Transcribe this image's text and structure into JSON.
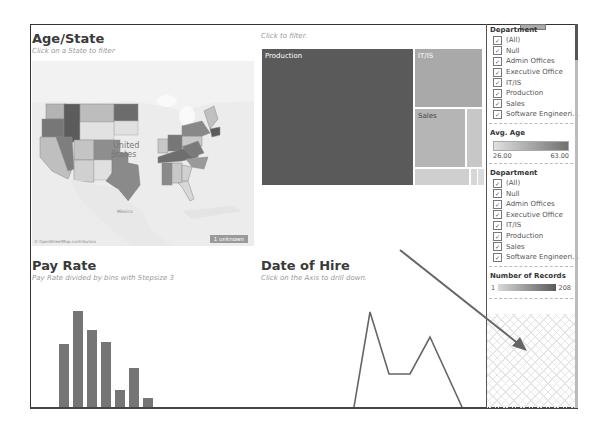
{
  "age_state": {
    "title": "Age/State",
    "subtitle": "Click on a State to filter",
    "map_label_line1": "United",
    "map_label_line2": "States",
    "mexico_label": "Mexico",
    "attribution": "© OpenStreetMap contributors",
    "unknown_badge": "1 unknown"
  },
  "treemap": {
    "subtitle": "Click to filter.",
    "cells": [
      {
        "label": "Production",
        "x": 0,
        "y": 0,
        "w": 153,
        "h": 138,
        "color": "#5a5a5a",
        "text_color": "#ffffff"
      },
      {
        "label": "IT/IS",
        "x": 153,
        "y": 0,
        "w": 69,
        "h": 60,
        "color": "#a9a9a9",
        "text_color": "#ffffff"
      },
      {
        "label": "Sales",
        "x": 153,
        "y": 60,
        "w": 52,
        "h": 60,
        "color": "#b5b5b5",
        "text_color": "#444444"
      },
      {
        "label": "",
        "x": 205,
        "y": 60,
        "w": 17,
        "h": 60,
        "color": "#c7c7c7",
        "text_color": "#444444"
      },
      {
        "label": "",
        "x": 153,
        "y": 120,
        "w": 56,
        "h": 18,
        "color": "#cfcfcf",
        "text_color": "#444444"
      },
      {
        "label": "",
        "x": 209,
        "y": 120,
        "w": 7,
        "h": 18,
        "color": "#d6d6d6",
        "text_color": "#444444"
      },
      {
        "label": "",
        "x": 216,
        "y": 120,
        "w": 6,
        "h": 18,
        "color": "#dcdcdc",
        "text_color": "#444444"
      }
    ]
  },
  "side_panel": {
    "filter1": {
      "title": "Department",
      "items": [
        "(All)",
        "Null",
        "Admin Offices",
        "Executive Office",
        "IT/IS",
        "Production",
        "Sales",
        "Software Engineeri..."
      ]
    },
    "avg_age": {
      "title": "Avg. Age",
      "min": "26.00",
      "max": "63.00"
    },
    "filter2": {
      "title": "Department",
      "items": [
        "(All)",
        "Null",
        "Admin Offices",
        "Executive Office",
        "IT/IS",
        "Production",
        "Sales",
        "Software Engineeri..."
      ]
    },
    "records": {
      "title": "Number of Records",
      "min": "1",
      "max": "208"
    }
  },
  "pay_rate": {
    "title": "Pay Rate",
    "subtitle": "Pay Rate divided by bins with Stepsize 3"
  },
  "date_of_hire": {
    "title": "Date of Hire",
    "subtitle": "Click on the Axis to drill down."
  },
  "chart_data": [
    {
      "type": "bar",
      "title": "Pay Rate",
      "subtitle": "Pay Rate divided by bins with Stepsize 3",
      "categories": [
        "bin1",
        "bin2",
        "bin3",
        "bin4",
        "bin5",
        "bin6",
        "bin7"
      ],
      "values": [
        72,
        110,
        89,
        75,
        19,
        45,
        10
      ],
      "xlabel": "",
      "ylabel": ""
    },
    {
      "type": "line",
      "title": "Date of Hire",
      "subtitle": "Click on the Axis to drill down.",
      "x": [
        0,
        1,
        2,
        3,
        4,
        5
      ],
      "values": [
        0,
        95,
        33,
        33,
        70,
        0
      ],
      "xlabel": "",
      "ylabel": ""
    }
  ]
}
